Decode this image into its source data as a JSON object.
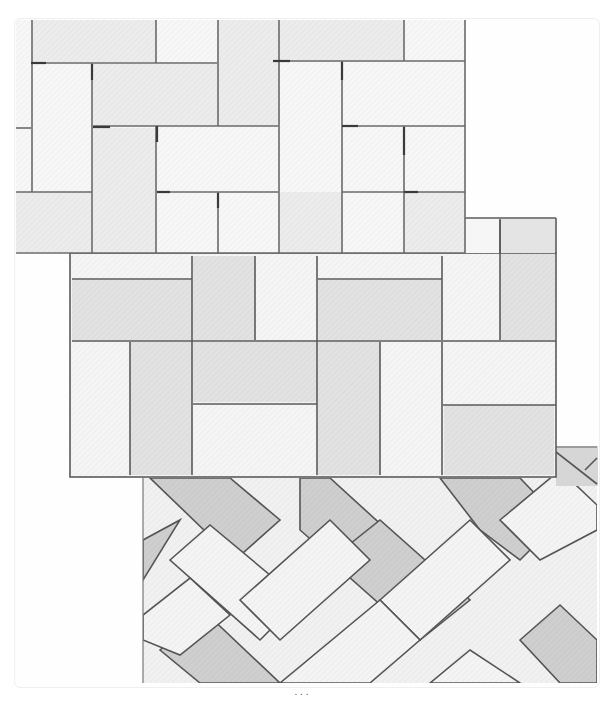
{
  "figure": {
    "panels": [
      {
        "name": "basketweave-top",
        "pattern": "Pinwheel / basketweave with half-brick offset",
        "fill": "#f2f2f2",
        "line": "#6a6a6a"
      },
      {
        "name": "basketweave-middle",
        "pattern": "Stack-bond basketweave with mixed orientation",
        "fill": "#ececec",
        "line": "#5c5c5c"
      },
      {
        "name": "herringbone-bottom",
        "pattern": "Diagonal herringbone",
        "fill_light": "#efefef",
        "fill_dark": "#cfcfcf",
        "line": "#555555"
      }
    ],
    "caption": ". . ."
  },
  "colors": {
    "background": "#ffffff",
    "brick_light": "#f4f4f4",
    "brick_mid": "#e6e6e6",
    "brick_dark": "#cdcdcd",
    "joint": "#5a5a5a"
  }
}
